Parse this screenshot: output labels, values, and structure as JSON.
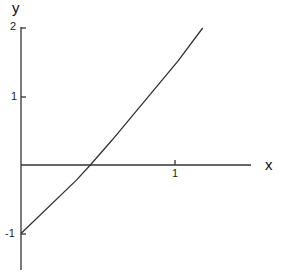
{
  "chart_data": {
    "type": "line",
    "title": "",
    "xlabel": "x",
    "ylabel": "y",
    "xlim": [
      0,
      1.6
    ],
    "ylim": [
      -1.35,
      2
    ],
    "grid": false,
    "x_ticks": [
      "1"
    ],
    "y_ticks": [
      "2",
      "1",
      "-1"
    ],
    "series": [
      {
        "name": "curve",
        "x": [
          0,
          0.36,
          0.45,
          0.59,
          1.02,
          1.18
        ],
        "y": [
          -1,
          -0.22,
          0,
          0.36,
          1.52,
          2.0
        ]
      }
    ]
  },
  "labels": {
    "x_axis": "x",
    "y_axis": "y",
    "tick_y2": "2",
    "tick_y1": "1",
    "tick_ym1": "-1",
    "tick_x1": "1"
  }
}
